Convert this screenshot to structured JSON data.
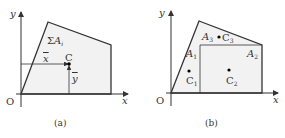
{
  "panel_a": {
    "caption": "(a)",
    "y_axis": "y",
    "x_axis": "x",
    "origin": "O",
    "area_label_sigma": "Σ",
    "area_label_A": "A",
    "area_label_sub": "i",
    "centroid_label": "C",
    "xbar": "x",
    "ybar": "y"
  },
  "panel_b": {
    "caption": "(b)",
    "y_axis": "y",
    "x_axis": "x",
    "origin": "O",
    "A1": "A",
    "A1_sub": "1",
    "A2": "A",
    "A2_sub": "2",
    "A3": "A",
    "A3_sub": "3",
    "C1": "C",
    "C1_sub": "1",
    "C2": "C",
    "C2_sub": "2",
    "C3": "C",
    "C3_sub": "3"
  },
  "colors": {
    "line": "#333333",
    "fill": "#eeeeee"
  }
}
